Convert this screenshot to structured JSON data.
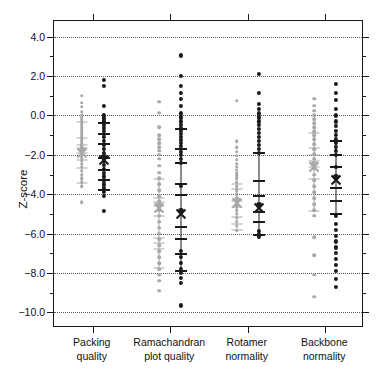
{
  "chart_data": {
    "type": "scatter",
    "title": "",
    "xlabel": "",
    "ylabel": "Z-score",
    "ylim": [
      -10.8,
      4.8
    ],
    "grid": true,
    "legend_position": "none",
    "y_ticks_major": [
      4.0,
      2.0,
      0.0,
      -2.0,
      -4.0,
      -6.0,
      -8.0,
      -10.0
    ],
    "y_tick_labels": [
      "4.0",
      "2.0",
      "0.0",
      "-2.0",
      "-4.0",
      "-6.0",
      "-8.0",
      "-10.0"
    ],
    "y_ticks_minor": [
      3.0,
      1.0,
      -1.0,
      -3.0,
      -5.0,
      -7.0,
      -9.0
    ],
    "categories": [
      "Packing quality",
      "Ramachandran plot quality",
      "Rotamer normality",
      "Backbone normality"
    ],
    "category_labels": [
      [
        "Packing",
        "quality"
      ],
      [
        "Ramachandran",
        "plot quality"
      ],
      [
        "Rotamer",
        "normality"
      ],
      [
        "Backbone",
        "normality"
      ]
    ],
    "series": [
      {
        "name": "gray",
        "color": "#a8a8a8",
        "groups": [
          {
            "category": "Packing quality",
            "mean": -1.75,
            "whisker_low": -3.5,
            "whisker_high": -0.3,
            "ticks": [
              -0.35,
              -1.15,
              -1.5,
              -1.65,
              -1.9,
              -2.25,
              -2.65,
              -3.45
            ],
            "values": [
              1.0,
              0.65,
              0.45,
              0.2,
              0.0,
              -0.15,
              -0.3,
              -0.45,
              -0.6,
              -0.75,
              -0.9,
              -1.05,
              -1.2,
              -1.3,
              -1.45,
              -1.55,
              -1.6,
              -1.7,
              -1.8,
              -1.9,
              -2.0,
              -2.1,
              -2.2,
              -2.3,
              -2.45,
              -2.6,
              -2.8,
              -3.0,
              -3.2,
              -3.4,
              -3.6,
              -4.4
            ]
          },
          {
            "category": "Ramachandran plot quality",
            "mean": -4.55,
            "whisker_low": -7.9,
            "whisker_high": -3.2,
            "ticks": [
              -3.25,
              -4.2,
              -4.4,
              -4.6,
              -5.1,
              -6.25,
              -6.5,
              -6.8,
              -7.75
            ],
            "values": [
              0.7,
              0.15,
              -0.6,
              -1.0,
              -1.2,
              -1.4,
              -1.6,
              -1.8,
              -2.0,
              -2.2,
              -2.55,
              -2.9,
              -3.2,
              -3.5,
              -3.8,
              -4.1,
              -4.35,
              -4.55,
              -4.8,
              -5.1,
              -5.4,
              -5.7,
              -6.0,
              -6.3,
              -6.6,
              -6.9,
              -7.2,
              -7.5,
              -7.8,
              -8.1,
              -8.4,
              -8.9
            ]
          },
          {
            "category": "Rotamer normality",
            "mean": -4.3,
            "whisker_low": -5.85,
            "whisker_high": -3.45,
            "ticks": [
              -3.5,
              -3.75,
              -4.35,
              -4.65,
              -5.15,
              -5.5,
              -5.8
            ],
            "values": [
              0.75,
              -1.3,
              -1.6,
              -1.85,
              -2.05,
              -2.25,
              -2.45,
              -2.6,
              -2.75,
              -2.9,
              -3.05,
              -3.2,
              -3.4,
              -3.6,
              -3.8,
              -4.0,
              -4.2,
              -4.4,
              -4.6,
              -4.8,
              -5.0,
              -5.2,
              -5.4,
              -5.6,
              -5.85
            ]
          },
          {
            "category": "Backbone normality",
            "mean": -2.45,
            "whisker_low": -4.9,
            "whisker_high": -0.85,
            "ticks": [
              -0.9,
              -1.65,
              -2.0,
              -2.3,
              -2.6,
              -3.25,
              -4.85
            ],
            "values": [
              0.85,
              0.5,
              0.25,
              0.0,
              -0.2,
              -0.4,
              -0.6,
              -0.8,
              -1.0,
              -1.2,
              -1.45,
              -1.7,
              -1.95,
              -2.2,
              -2.45,
              -2.7,
              -3.0,
              -3.3,
              -3.6,
              -3.9,
              -4.2,
              -4.5,
              -4.8,
              -5.1,
              -6.2,
              -7.1,
              -8.1,
              -9.2
            ]
          }
        ]
      },
      {
        "name": "black",
        "color": "#1a1a1a",
        "groups": [
          {
            "category": "Packing quality",
            "mean": -2.1,
            "whisker_low": -3.85,
            "whisker_high": -0.35,
            "ticks": [
              -0.4,
              -0.95,
              -1.45,
              -2.15,
              -2.75,
              -3.3,
              -3.8
            ],
            "values": [
              1.8,
              1.5,
              0.5,
              0.0,
              -0.15,
              -0.3,
              -0.5,
              -0.65,
              -0.8,
              -0.95,
              -1.1,
              -1.3,
              -1.5,
              -1.7,
              -1.9,
              -2.1,
              -2.3,
              -2.5,
              -2.7,
              -2.9,
              -3.1,
              -3.3,
              -3.5,
              -3.7,
              -3.9,
              -4.1,
              -4.85
            ]
          },
          {
            "category": "Ramachandran plot quality",
            "mean": -4.85,
            "whisker_low": -7.95,
            "whisker_high": -0.65,
            "ticks": [
              -0.7,
              -1.7,
              -2.4,
              -3.5,
              -4.05,
              -5.65,
              -6.3,
              -7.05,
              -7.9
            ],
            "values": [
              3.05,
              2.0,
              1.5,
              1.15,
              0.85,
              0.5,
              0.1,
              -0.1,
              -0.3,
              -0.5,
              -0.65,
              -0.8,
              -0.95,
              -1.1,
              -1.25,
              -1.4,
              -1.55,
              -1.7,
              -1.85,
              -2.0,
              -2.2,
              -2.4,
              -3.6,
              -4.85,
              -6.9,
              -7.2,
              -7.5,
              -7.8,
              -8.0,
              -8.25,
              -8.5,
              -9.65
            ]
          },
          {
            "category": "Rotamer normality",
            "mean": -4.55,
            "whisker_low": -6.1,
            "whisker_high": -1.85,
            "ticks": [
              -1.9,
              -3.35,
              -4.1,
              -4.9,
              -5.4,
              -6.05
            ],
            "values": [
              2.1,
              1.15,
              0.6,
              0.35,
              0.1,
              -0.1,
              -0.3,
              -0.5,
              -0.7,
              -0.9,
              -1.1,
              -1.3,
              -1.5,
              -1.7,
              -1.9,
              -4.55,
              -5.85,
              -6.0,
              -6.15
            ]
          },
          {
            "category": "Backbone normality",
            "mean": -3.15,
            "whisker_low": -5.05,
            "whisker_high": -1.25,
            "ticks": [
              -1.3,
              -2.0,
              -2.6,
              -3.7,
              -4.35,
              -5.0
            ],
            "values": [
              1.6,
              1.15,
              0.8,
              0.35,
              0.0,
              -0.3,
              -0.55,
              -0.8,
              -1.0,
              -1.2,
              -1.4,
              -1.6,
              -1.8,
              -2.0,
              -2.6,
              -3.15,
              -5.1,
              -5.5,
              -5.8,
              -6.1,
              -6.4,
              -6.7,
              -7.0,
              -7.3,
              -7.6,
              -7.9,
              -8.3,
              -8.7
            ]
          }
        ]
      }
    ]
  },
  "axis": {
    "y_title": "Z-score"
  }
}
